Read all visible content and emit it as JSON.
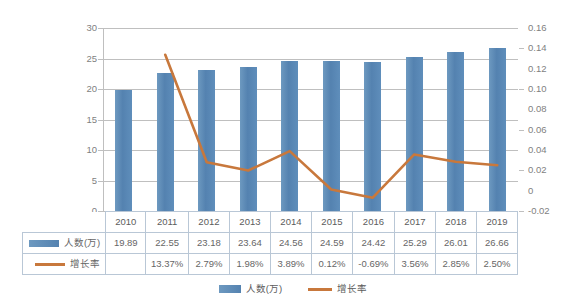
{
  "chart_data": {
    "type": "bar",
    "title": "",
    "xlabel": "",
    "ylabel": "",
    "grid": true,
    "legend_position": "bottom",
    "categories": [
      "2010",
      "2011",
      "2012",
      "2013",
      "2014",
      "2015",
      "2016",
      "2017",
      "2018",
      "2019"
    ],
    "series": [
      {
        "name": "人数(万)",
        "type": "bar",
        "axis": "left",
        "color": "#5b8cb8",
        "values": [
          19.89,
          22.55,
          23.18,
          23.64,
          24.56,
          24.59,
          24.42,
          25.29,
          26.01,
          26.66
        ],
        "labels": [
          "19.89",
          "22.55",
          "23.18",
          "23.64",
          "24.56",
          "24.59",
          "24.42",
          "25.29",
          "26.01",
          "26.66"
        ]
      },
      {
        "name": "增长率",
        "type": "line",
        "axis": "right",
        "color": "#c8783c",
        "values": [
          null,
          0.1337,
          0.0279,
          0.0198,
          0.0389,
          0.0012,
          -0.0069,
          0.0356,
          0.0285,
          0.025
        ],
        "labels": [
          "",
          "13.37%",
          "2.79%",
          "1.98%",
          "3.89%",
          "0.12%",
          "-0.69%",
          "3.56%",
          "2.85%",
          "2.50%"
        ]
      }
    ],
    "left_axis": {
      "min": 0,
      "max": 30,
      "ticks": [
        0,
        5,
        10,
        15,
        20,
        25,
        30
      ],
      "tick_labels": [
        "0",
        "5",
        "10",
        "15",
        "20",
        "25",
        "30"
      ]
    },
    "right_axis": {
      "min": -0.02,
      "max": 0.16,
      "ticks": [
        -0.02,
        0,
        0.02,
        0.04,
        0.06,
        0.08,
        0.1,
        0.12,
        0.14,
        0.16
      ],
      "tick_labels": [
        "-0.02",
        "0",
        "0.02",
        "0.04",
        "0.06",
        "0.08",
        "0.10",
        "0.12",
        "0.14",
        "0.16"
      ]
    }
  },
  "table": {
    "year_header": [
      "2010",
      "2011",
      "2012",
      "2013",
      "2014",
      "2015",
      "2016",
      "2017",
      "2018",
      "2019"
    ],
    "rows": [
      {
        "label": "人数(万)",
        "marker": "bar-swatch",
        "values": [
          "19.89",
          "22.55",
          "23.18",
          "23.64",
          "24.56",
          "24.59",
          "24.42",
          "25.29",
          "26.01",
          "26.66"
        ]
      },
      {
        "label": "增长率",
        "marker": "line-swatch",
        "values": [
          "",
          "13.37%",
          "2.79%",
          "1.98%",
          "3.89%",
          "0.12%",
          "-0.69%",
          "3.56%",
          "2.85%",
          "2.50%"
        ]
      }
    ]
  },
  "legend": {
    "items": [
      {
        "label": "人数(万)",
        "marker": "bar-swatch",
        "color": "#5b8cb8"
      },
      {
        "label": "增长率",
        "marker": "line-swatch",
        "color": "#c8783c"
      }
    ]
  },
  "colors": {
    "bar": "#5b8cb8",
    "line": "#c8783c",
    "grid": "#bfbfbf",
    "text": "#7f7f7f",
    "table_border": "#b9c7d6"
  }
}
